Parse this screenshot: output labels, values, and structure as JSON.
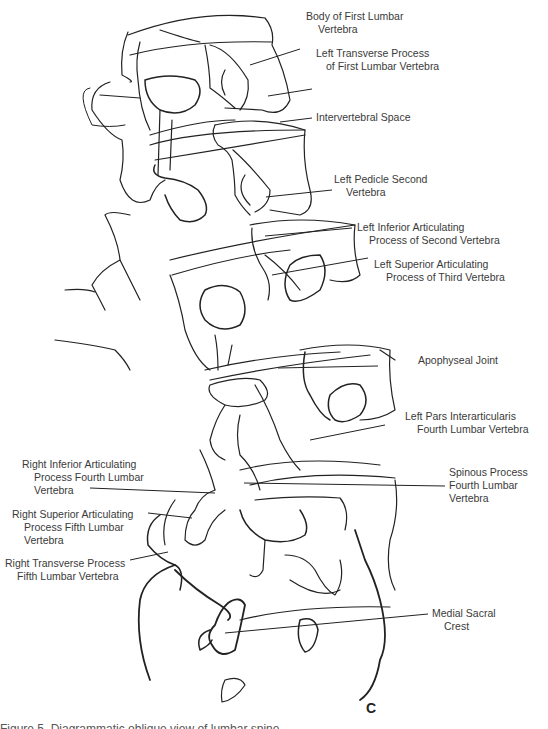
{
  "figure": {
    "panel_letter": "C",
    "caption_partial": "Figure 5. Diagrammatic oblique view of lumbar spine",
    "labels": [
      {
        "id": "body-first-lumbar",
        "lines": [
          "Body of First Lumbar",
          "Vertebra"
        ]
      },
      {
        "id": "left-transverse-first",
        "lines": [
          "Left Transverse Process",
          "of First Lumbar Vertebra"
        ]
      },
      {
        "id": "intervertebral-space",
        "lines": [
          "Intervertebral Space"
        ]
      },
      {
        "id": "left-pedicle-second",
        "lines": [
          "Left Pedicle Second",
          "Vertebra"
        ]
      },
      {
        "id": "left-inferior-articulating-second",
        "lines": [
          "Left Inferior Articulating",
          "Process of Second Vertebra"
        ]
      },
      {
        "id": "left-superior-articulating-third",
        "lines": [
          "Left Superior Articulating",
          "Process of Third Vertebra"
        ]
      },
      {
        "id": "apophyseal-joint",
        "lines": [
          "Apophyseal Joint"
        ]
      },
      {
        "id": "left-pars-interarticularis",
        "lines": [
          "Left Pars Interarticularis",
          "Fourth Lumbar Vertebra"
        ]
      },
      {
        "id": "spinous-process-fourth",
        "lines": [
          "Spinous Process",
          "Fourth Lumbar",
          "Vertebra"
        ]
      },
      {
        "id": "right-inferior-articulating-fourth",
        "lines": [
          "Right Inferior Articulating",
          "Process Fourth Lumbar",
          "Vertebra"
        ]
      },
      {
        "id": "right-superior-articulating-fifth",
        "lines": [
          "Right Superior Articulating",
          "Process Fifth Lumbar",
          "Vertebra"
        ]
      },
      {
        "id": "right-transverse-fifth",
        "lines": [
          "Right Transverse Process",
          "Fifth Lumbar Vertebra"
        ]
      },
      {
        "id": "medial-sacral-crest",
        "lines": [
          "Medial Sacral",
          "Crest"
        ]
      }
    ]
  }
}
